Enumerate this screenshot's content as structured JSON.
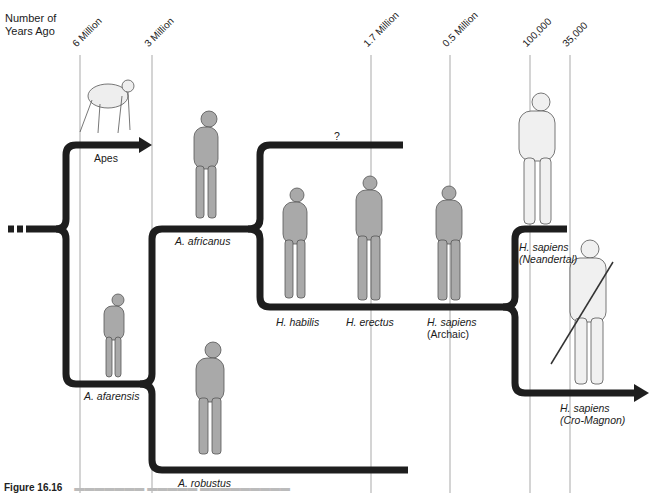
{
  "axis": {
    "title_line1": "Number of",
    "title_line2": "Years Ago",
    "ticks": [
      {
        "label": "6 Million",
        "x": 80
      },
      {
        "label": "3 Million",
        "x": 152
      },
      {
        "label": "1.7 Million",
        "x": 371
      },
      {
        "label": "0.5 Million",
        "x": 450
      },
      {
        "label": "100,000",
        "x": 530
      },
      {
        "label": "35,000",
        "x": 570
      }
    ]
  },
  "branches": {
    "apes": {
      "label": "Apes"
    },
    "unknown": {
      "label": "?"
    },
    "africanus": {
      "label": "A. africanus"
    },
    "afarensis": {
      "label": "A. afarensis"
    },
    "robustus": {
      "label": "A. robustus"
    },
    "habilis": {
      "label": "H. habilis"
    },
    "erectus": {
      "label": "H. erectus"
    },
    "sapiens_archaic": {
      "label_line1": "H. sapiens",
      "label_line2": "(Archaic)"
    },
    "neandertal": {
      "label_line1": "H. sapiens",
      "label_line2": "(Neandertal)"
    },
    "cromagnon": {
      "label_line1": "H. sapiens",
      "label_line2": "(Cro-Magnon)"
    }
  },
  "colors": {
    "branch": "#1e1e1e",
    "timeline": "#b8b8b8",
    "figure_fill": "#a9a9a9",
    "figure_stroke": "#555555"
  },
  "caption": {
    "label": "Figure 16.16"
  }
}
